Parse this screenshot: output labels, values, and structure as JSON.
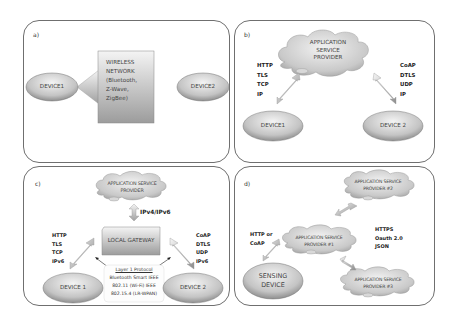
{
  "panels": {
    "a": {
      "label": "a)",
      "device1": "DEVICE1",
      "device2": "DEVICE2",
      "network_lines": [
        "WIRELESS",
        "NETWORK",
        "(Bluetooth,",
        "Z-Wave,",
        "ZigBee)"
      ]
    },
    "b": {
      "label": "b)",
      "cloud_lines": [
        "APPLICATION",
        "SERVICE",
        "PROVIDER"
      ],
      "left_protocols": [
        "HTTP",
        "TLS",
        "TCP",
        "IP"
      ],
      "right_protocols": [
        "CoAP",
        "DTLS",
        "UDP",
        "IP"
      ],
      "device1": "DEVICE1",
      "device2": "DEVICE 2"
    },
    "c": {
      "label": "c)",
      "cloud_lines": [
        "APPLICATION SERVICE",
        "PROVIDER"
      ],
      "uplink_label": "IPv4/IPv6",
      "gateway": "LOCAL GATEWAY",
      "left_protocols": [
        "HTTP",
        "TLS",
        "TCP",
        "IPv6"
      ],
      "right_protocols": [
        "CoAP",
        "DTLS",
        "UDP",
        "IPv6"
      ],
      "layer1_title": "Layer 1 Protocol",
      "layer1_lines": [
        "Bluetooth Smart IEEE",
        "802.11 (Wi-Fi) IEEE",
        "802.15.4 (LR-WPAN)"
      ],
      "device1": "DEVICE 1",
      "device2": "DEVICE 2"
    },
    "d": {
      "label": "d)",
      "provider2_lines": [
        "APPLICATION SERVICE",
        "PROVIDER #2"
      ],
      "provider1_lines": [
        "APPLICATION SERVICE",
        "PROVIDER #1"
      ],
      "provider3_lines": [
        "APPLICATION SERVICE",
        "PROVIDER #3"
      ],
      "left_protocols": [
        "HTTP or",
        "CoAP"
      ],
      "right_protocols": [
        "HTTPS",
        "Oauth 2.0",
        "JSON"
      ],
      "sensing_lines": [
        "SENSING",
        "DEVICE"
      ]
    }
  },
  "colors": {
    "border": "#6f6f6f",
    "shape_light": "#f2f2f2",
    "shape_dark": "#9a9a9a",
    "text": "#444444"
  }
}
